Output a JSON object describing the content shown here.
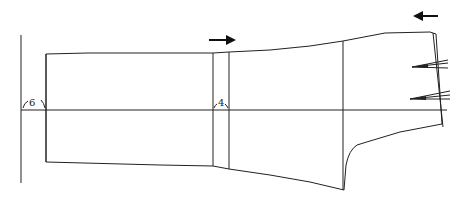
{
  "diagram": {
    "type": "sleeve pattern draft",
    "labels": {
      "left_angle": "6",
      "middle_angle": "4"
    },
    "arrows": [
      {
        "name": "arrow-right",
        "direction": "right"
      },
      {
        "name": "arrow-left",
        "direction": "left"
      }
    ],
    "colors": {
      "line": "#222222",
      "background": "#ffffff"
    }
  }
}
